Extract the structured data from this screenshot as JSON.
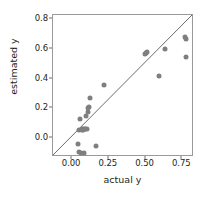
{
  "chart_data": {
    "type": "scatter",
    "title": "",
    "xlabel": "actual y",
    "ylabel": "estimated y",
    "xlim": [
      -0.13,
      0.83
    ],
    "ylim": [
      -0.13,
      0.83
    ],
    "grid": false,
    "legend": null,
    "point_color": "#7f7f7f",
    "line_color": "#55595c",
    "axis_color": "#9a9a9a",
    "xticks": [
      0.0,
      0.25,
      0.5,
      0.75
    ],
    "xticklabels": [
      "0.00",
      "0.25",
      "0.50",
      "0.75"
    ],
    "yticks": [
      0.0,
      0.2,
      0.4,
      0.6,
      0.8
    ],
    "yticklabels": [
      "0.0",
      "0.2",
      "0.4",
      "0.6",
      "0.8"
    ],
    "reference_line": {
      "name": "identity-line",
      "equation": "y = x",
      "x0": -0.13,
      "y0": -0.13,
      "x1": 0.83,
      "y1": 0.83
    },
    "x": [
      0.04,
      0.045,
      0.05,
      0.052,
      0.06,
      0.065,
      0.068,
      0.072,
      0.075,
      0.08,
      0.085,
      0.09,
      0.095,
      0.1,
      0.105,
      0.11,
      0.115,
      0.12,
      0.165,
      0.22,
      0.495,
      0.505,
      0.51,
      0.595,
      0.63,
      0.77,
      0.775,
      0.778
    ],
    "y": [
      -0.04,
      -0.095,
      0.055,
      0.13,
      -0.1,
      0.05,
      0.058,
      0.055,
      0.06,
      -0.1,
      0.06,
      0.062,
      0.15,
      0.062,
      0.175,
      0.2,
      0.205,
      0.27,
      -0.055,
      0.355,
      0.565,
      0.57,
      0.58,
      0.42,
      0.6,
      0.68,
      0.665,
      0.545
    ]
  }
}
